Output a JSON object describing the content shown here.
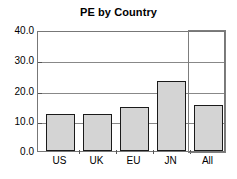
{
  "chart_data": {
    "type": "bar",
    "title": "PE by Country",
    "xlabel": "",
    "ylabel": "",
    "categories": [
      "US",
      "UK",
      "EU",
      "JN",
      "All"
    ],
    "values": [
      12.5,
      12.4,
      14.9,
      23.5,
      15.3
    ],
    "ylim": [
      0.0,
      40.0
    ],
    "yticks": [
      "0.0",
      "10.0",
      "20.0",
      "30.0",
      "40.0"
    ],
    "ytick_values": [
      0.0,
      10.0,
      20.0,
      30.0,
      40.0
    ],
    "grid": true,
    "legend": "none",
    "bar_fill_color": "#d4d4d4",
    "bar_edge_color": "#1a1a1a",
    "frame_color": "#777777",
    "gridline_color": "#888888",
    "highlight_color": "#7d7d7d",
    "annotations": [
      {
        "name": "all-group-highlight-box",
        "description": "Rectangle outlining the All category column",
        "category": "All"
      }
    ]
  },
  "title": {
    "text": "PE by Country"
  },
  "axes": {
    "y": {
      "labels": [
        "40.0",
        "30.0",
        "20.0",
        "10.0",
        "0.0"
      ]
    },
    "x": {
      "labels": [
        "US",
        "UK",
        "EU",
        "JN",
        "All"
      ]
    }
  }
}
